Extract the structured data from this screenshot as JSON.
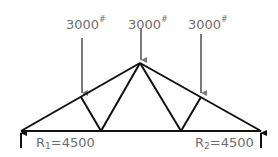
{
  "diagram": {
    "type": "truss",
    "loads": [
      {
        "value": "3000",
        "unit": "#"
      },
      {
        "value": "3000",
        "unit": "#"
      },
      {
        "value": "3000",
        "unit": "#"
      }
    ],
    "reactions": [
      {
        "name": "R",
        "sub": "1",
        "value": "=4500"
      },
      {
        "name": "R",
        "sub": "2",
        "value": "=4500"
      }
    ],
    "colors": {
      "members": "#111111",
      "loads": "#7a7a7a",
      "text": "#6e6e6e"
    }
  }
}
